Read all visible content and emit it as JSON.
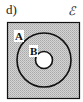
{
  "diagram": {
    "part_label": "d)",
    "universal_symbol": "ℰ",
    "sets": [
      {
        "name": "A",
        "label": "A"
      },
      {
        "name": "B",
        "label": "B"
      }
    ],
    "shading_color": "#c8c8c8",
    "outline_color": "#111111"
  }
}
